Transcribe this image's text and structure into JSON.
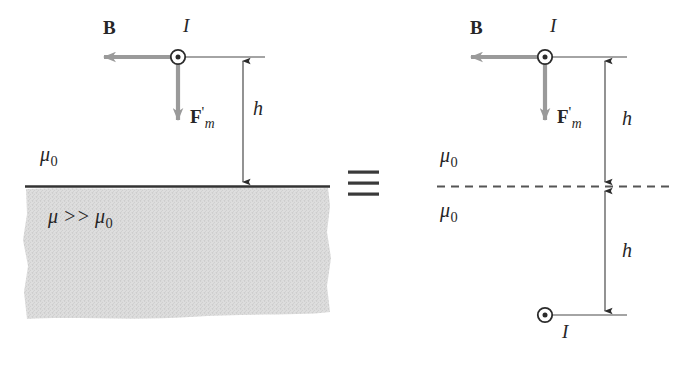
{
  "figure": {
    "title_alt": "Magnetic image of a line current above a high-permeability medium",
    "equivalence_symbol": "identical-to",
    "colors": {
      "line": "#2b2b2b",
      "gray_arrow": "#9a9a9a",
      "shading": "#d9d9d9",
      "text": "#262626",
      "interface_line": "#333333"
    },
    "left_panel": {
      "labels": {
        "B_field": "B",
        "current": "I",
        "force": "F",
        "force_prime": "'",
        "force_subscript": "m",
        "height": "h",
        "mu_above": "μ",
        "mu_above_subscript": "0",
        "mu_below": "μ >> μ",
        "mu_below_subscript": "0"
      },
      "geometry": {
        "current_x": 178,
        "current_y": 57,
        "interface_y": 186,
        "height_arrow_x": 243,
        "lead_line_end_x": 265,
        "b_arrow_tip_x": 97,
        "force_arrow_end_y": 128,
        "shading_top": 188,
        "shading_bottom": 320,
        "shading_left": 25,
        "shading_right": 330
      }
    },
    "right_panel": {
      "labels": {
        "B_field": "B",
        "current_top": "I",
        "current_bottom": "I",
        "force": "F",
        "force_prime": "'",
        "force_subscript": "m",
        "height_top": "h",
        "height_bottom": "h",
        "mu_above": "μ",
        "mu_above_subscript": "0",
        "mu_below": "μ",
        "mu_below_subscript": "0"
      },
      "geometry": {
        "current_x": 545,
        "current_y": 57,
        "image_current_x": 545,
        "image_current_y": 315,
        "dashed_line_y": 186,
        "dashed_line_x1": 437,
        "dashed_line_x2": 672,
        "height_arrow_x": 605,
        "lead_line_end_x": 627,
        "b_arrow_tip_x": 464,
        "force_arrow_end_y": 128
      }
    }
  }
}
